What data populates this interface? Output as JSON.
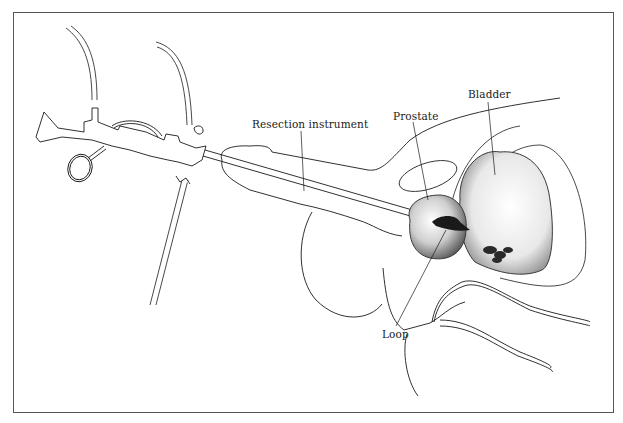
{
  "figure": {
    "type": "medical-illustration",
    "frame_color": "#555555",
    "line_color": "#1a1a1a",
    "labels": [
      {
        "id": "resection-instrument",
        "text": "Resection instrument",
        "x": 252,
        "y": 125
      },
      {
        "id": "prostate",
        "text": "Prostate",
        "x": 393,
        "y": 117
      },
      {
        "id": "bladder",
        "text": "Bladder",
        "x": 468,
        "y": 95
      },
      {
        "id": "loop",
        "text": "Loop",
        "x": 382,
        "y": 335
      }
    ]
  }
}
